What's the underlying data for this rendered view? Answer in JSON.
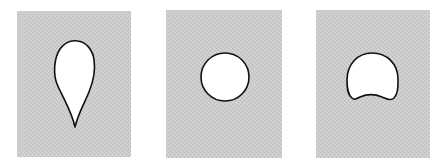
{
  "figure": {
    "background_color": "#ffffff",
    "panel_color": "#c9c9c9",
    "shape_fill": "#ffffff",
    "shape_stroke": "#111111",
    "panels": [
      {
        "id": "panel-1",
        "shape": "teardrop"
      },
      {
        "id": "panel-2",
        "shape": "circle"
      },
      {
        "id": "panel-3",
        "shape": "dome-with-concave-base"
      }
    ]
  }
}
